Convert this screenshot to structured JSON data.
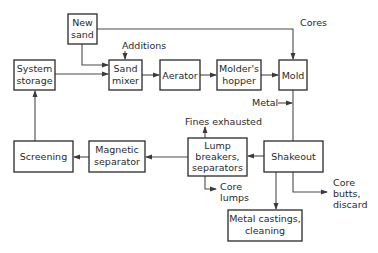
{
  "diagram": {
    "type": "flowchart",
    "nodes": {
      "new_sand": {
        "lines": [
          "New",
          "sand"
        ]
      },
      "system_storage": {
        "lines": [
          "System",
          "storage"
        ]
      },
      "sand_mixer": {
        "lines": [
          "Sand",
          "mixer"
        ]
      },
      "aerator": {
        "lines": [
          "Aerator"
        ]
      },
      "molders_hopper": {
        "lines": [
          "Molder's",
          "hopper"
        ]
      },
      "mold": {
        "lines": [
          "Mold"
        ]
      },
      "screening": {
        "lines": [
          "Screening"
        ]
      },
      "magnetic_separator": {
        "lines": [
          "Magnetic",
          "separator"
        ]
      },
      "lump_breakers": {
        "lines": [
          "Lump",
          "breakers,",
          "separators"
        ]
      },
      "shakeout": {
        "lines": [
          "Shakeout"
        ]
      },
      "metal_castings": {
        "lines": [
          "Metal castings,",
          "cleaning"
        ]
      }
    },
    "labels": {
      "additions": "Additions",
      "cores": "Cores",
      "metal": "Metal",
      "fines_exhausted": "Fines exhausted",
      "core_lumps": [
        "Core",
        "lumps"
      ],
      "core_butts": [
        "Core",
        "butts,",
        "discard"
      ]
    },
    "edges": [
      {
        "from": "New sand",
        "to": "Sand mixer"
      },
      {
        "from": "New sand",
        "to": "Mold",
        "label": "Cores"
      },
      {
        "from": "System storage",
        "to": "Sand mixer"
      },
      {
        "from": "Additions",
        "to": "Sand mixer"
      },
      {
        "from": "Sand mixer",
        "to": "Aerator"
      },
      {
        "from": "Aerator",
        "to": "Molder's hopper"
      },
      {
        "from": "Molder's hopper",
        "to": "Mold"
      },
      {
        "from": "Metal",
        "to": "Mold-Shakeout line"
      },
      {
        "from": "Mold",
        "to": "Shakeout"
      },
      {
        "from": "Shakeout",
        "to": "Lump breakers, separators"
      },
      {
        "from": "Shakeout",
        "to": "Metal castings, cleaning"
      },
      {
        "from": "Shakeout",
        "to": "Core butts, discard"
      },
      {
        "from": "Lump breakers, separators",
        "to": "Fines exhausted"
      },
      {
        "from": "Lump breakers, separators",
        "to": "Core lumps"
      },
      {
        "from": "Lump breakers, separators",
        "to": "Magnetic separator"
      },
      {
        "from": "Magnetic separator",
        "to": "Screening"
      },
      {
        "from": "Screening",
        "to": "System storage"
      }
    ]
  }
}
